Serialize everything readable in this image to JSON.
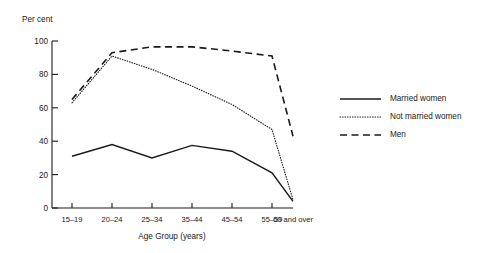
{
  "chart_data": {
    "type": "line",
    "title": "",
    "unit_label": "Per cent",
    "xlabel": "Age Group (years)",
    "ylabel": "",
    "categories": [
      "15–19",
      "20–24",
      "25–34",
      "35–44",
      "45–54",
      "55–59",
      "60 and over"
    ],
    "yticks": [
      0,
      20,
      40,
      60,
      80,
      100
    ],
    "ylim": [
      0,
      100
    ],
    "grid": false,
    "legend_position": "right",
    "series": [
      {
        "name": "Married women",
        "style": "solid",
        "color": "#1a1a1a",
        "values": [
          31,
          38,
          30,
          37.5,
          34,
          21,
          4
        ]
      },
      {
        "name": "Not married women",
        "style": "dotted",
        "color": "#1a1a1a",
        "values": [
          63,
          91,
          83,
          73,
          62,
          47,
          5
        ]
      },
      {
        "name": "Men",
        "style": "dashed",
        "color": "#1a1a1a",
        "values": [
          65,
          93,
          96.5,
          96.5,
          94,
          91,
          43
        ]
      }
    ]
  },
  "labels": {
    "ytick_0": "0",
    "ytick_20": "20",
    "ytick_40": "40",
    "ytick_60": "60",
    "ytick_80": "80",
    "ytick_100": "100"
  }
}
